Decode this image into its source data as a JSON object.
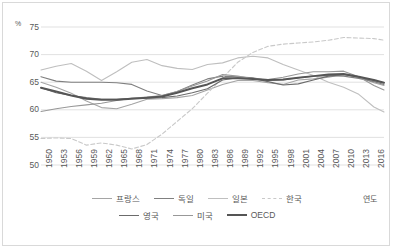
{
  "unit_label": "%",
  "axis": {
    "x_title": "연도",
    "y_ticks": [
      "75",
      "70",
      "65",
      "60",
      "55",
      "50"
    ],
    "x_ticks": [
      "1950",
      "1953",
      "1956",
      "1959",
      "1962",
      "1965",
      "1968",
      "1971",
      "1974",
      "1977",
      "1980",
      "1983",
      "1986",
      "1989",
      "1992",
      "1995",
      "1998",
      "2001",
      "2004",
      "2007",
      "2010",
      "2013",
      "2016"
    ]
  },
  "legend": {
    "row1": [
      {
        "label": "프랑스",
        "style": "solid",
        "color": "#a5a5a5"
      },
      {
        "label": "독일",
        "style": "solid",
        "color": "#808080"
      },
      {
        "label": "일본",
        "style": "solid",
        "color": "#bfbfbf"
      },
      {
        "label": "한국",
        "style": "dashed",
        "color": "#c9c9c9"
      }
    ],
    "row2": [
      {
        "label": "영국",
        "style": "solid",
        "color": "#6b6b6b"
      },
      {
        "label": "미국",
        "style": "solid",
        "color": "#989898"
      },
      {
        "label": "OECD",
        "style": "thick",
        "color": "#555555"
      }
    ]
  },
  "colors": {
    "gridline": "#d9d9d9",
    "border": "#d9d9d9",
    "text": "#595959",
    "plot_background": "#ffffff"
  },
  "chart_data": {
    "type": "line",
    "title": "",
    "subtitle": "",
    "xlabel": "연도",
    "ylabel": "%",
    "ylim": [
      50,
      75
    ],
    "xlim": [
      1950,
      2018
    ],
    "grid": true,
    "legend_position": "bottom",
    "x": [
      1950,
      1953,
      1956,
      1959,
      1962,
      1965,
      1968,
      1971,
      1974,
      1977,
      1980,
      1983,
      1986,
      1989,
      1992,
      1995,
      1998,
      2001,
      2004,
      2007,
      2010,
      2013,
      2016,
      2018
    ],
    "series": [
      {
        "name": "프랑스",
        "style": "solid",
        "color": "#a5a5a5",
        "width": 1.1,
        "values": [
          65.0,
          64.1,
          63.0,
          61.6,
          60.4,
          60.2,
          61.0,
          61.9,
          62.0,
          62.2,
          62.6,
          63.6,
          64.6,
          65.3,
          65.3,
          64.9,
          64.6,
          65.4,
          65.6,
          65.9,
          66.4,
          66.0,
          64.9,
          64.4
        ]
      },
      {
        "name": "독일",
        "style": "solid",
        "color": "#808080",
        "width": 1.1,
        "values": [
          66.0,
          65.2,
          65.0,
          65.0,
          65.0,
          64.9,
          64.6,
          63.4,
          62.6,
          63.3,
          64.5,
          65.6,
          66.1,
          66.0,
          65.8,
          65.3,
          65.4,
          65.8,
          66.1,
          66.2,
          66.1,
          65.7,
          65.1,
          64.6
        ]
      },
      {
        "name": "일본",
        "style": "solid",
        "color": "#bfbfbf",
        "width": 1.1,
        "values": [
          67.2,
          67.9,
          68.4,
          67.0,
          65.3,
          66.9,
          68.6,
          69.1,
          68.0,
          67.5,
          67.3,
          68.2,
          68.5,
          69.4,
          69.7,
          69.4,
          68.2,
          67.2,
          66.2,
          65.0,
          64.1,
          62.8,
          60.5,
          59.6
        ]
      },
      {
        "name": "한국",
        "style": "dashed",
        "color": "#c9c9c9",
        "width": 1.1,
        "values": [
          54.8,
          54.9,
          54.8,
          53.6,
          54.0,
          53.6,
          52.9,
          53.7,
          55.6,
          57.9,
          60.2,
          63.0,
          65.8,
          68.6,
          70.4,
          71.5,
          71.9,
          72.1,
          72.3,
          72.6,
          73.1,
          73.0,
          72.9,
          72.6
        ]
      },
      {
        "name": "영국",
        "style": "solid",
        "color": "#6b6b6b",
        "width": 1.1,
        "values": [
          64.0,
          63.1,
          62.6,
          62.2,
          61.9,
          61.9,
          62.1,
          62.1,
          62.2,
          62.5,
          63.1,
          63.8,
          65.4,
          65.8,
          65.7,
          65.1,
          64.5,
          64.7,
          65.4,
          66.1,
          66.4,
          65.9,
          65.3,
          64.9
        ]
      },
      {
        "name": "미국",
        "style": "solid",
        "color": "#989898",
        "width": 1.1,
        "values": [
          59.7,
          60.2,
          60.6,
          60.9,
          61.2,
          61.7,
          62.1,
          62.3,
          62.6,
          63.3,
          64.3,
          65.2,
          66.4,
          66.1,
          65.6,
          65.5,
          65.9,
          66.5,
          66.9,
          66.9,
          67.0,
          66.0,
          64.4,
          63.6
        ]
      },
      {
        "name": "OECD",
        "style": "thick",
        "color": "#555555",
        "width": 2.0,
        "values": [
          64.0,
          63.3,
          62.6,
          62.0,
          61.8,
          61.8,
          62.0,
          62.2,
          62.4,
          63.1,
          63.9,
          64.6,
          65.7,
          65.7,
          65.6,
          65.4,
          65.5,
          65.8,
          66.1,
          66.4,
          66.5,
          66.0,
          65.4,
          64.9
        ]
      }
    ]
  }
}
